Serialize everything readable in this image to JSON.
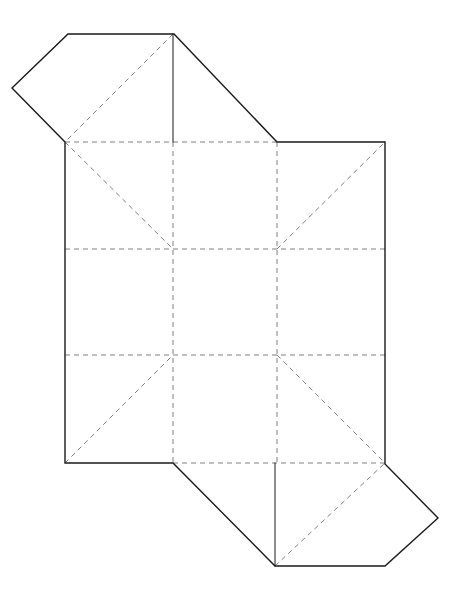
{
  "figure": {
    "canvas": {
      "width": 459,
      "height": 596,
      "background": "#ffffff"
    },
    "style": {
      "solid_color": "#1a1a1a",
      "solid_width": 1.4,
      "dashed_color": "#808080",
      "dashed_width": 1.0,
      "dash_pattern": "5,4"
    },
    "vertices": {
      "grid_x": [
        65,
        173,
        277,
        385
      ],
      "grid_y": [
        142,
        249,
        355,
        463
      ],
      "top_flap_apex_left_x": 68,
      "top_flap_apex_right_x": 174,
      "top_flap_y": 34,
      "left_point_x": 12,
      "left_point_y": 88,
      "bottom_flap_left_x": 275,
      "bottom_flap_right_x": 385,
      "bottom_flap_y": 566,
      "right_point_x": 438,
      "right_point_y": 518
    },
    "outline_path": "M 65 142 L 12 88 L 68 34 L 174 34 L 277 142 L 385 142 L 385 464 L 438 518 L 385 566 L 275 566 L 173 463 L 65 463 Z",
    "fold_lines": [
      {
        "name": "horizontal-fold-upper",
        "d": "M 65 249 L 385 249"
      },
      {
        "name": "horizontal-fold-lower",
        "d": "M 65 355 L 385 355"
      },
      {
        "name": "vertical-fold-left",
        "d": "M 173 142 L 173 463"
      },
      {
        "name": "vertical-fold-right",
        "d": "M 277 142 L 277 463"
      },
      {
        "name": "horizontal-fold-top",
        "d": "M 65 142 L 277 142"
      },
      {
        "name": "horizontal-fold-bottom",
        "d": "M 173 463 L 385 463"
      },
      {
        "name": "diagonal-top-left-cell",
        "d": "M 65 142 L 173 249"
      },
      {
        "name": "diagonal-top-flap",
        "d": "M 173 34 L 65 142"
      },
      {
        "name": "diagonal-top-right-cell",
        "d": "M 277 249 L 385 142"
      },
      {
        "name": "diagonal-bottom-left-cell",
        "d": "M 65 463 L 173 355"
      },
      {
        "name": "diagonal-bottom-right-cell",
        "d": "M 277 355 L 385 463"
      },
      {
        "name": "diagonal-bottom-flap",
        "d": "M 275 566 L 385 463"
      }
    ],
    "solid_interior_lines": [
      {
        "name": "vertical-edge-top-flap",
        "d": "M 173 34 L 173 142"
      },
      {
        "name": "vertical-edge-bottom-flap",
        "d": "M 275 463 L 275 566"
      }
    ]
  }
}
